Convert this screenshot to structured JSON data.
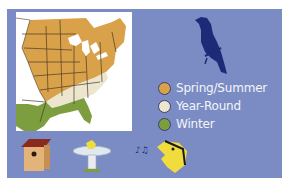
{
  "legend": {
    "items": [
      {
        "label": "Spring/Summer",
        "color": "#d9a24a"
      },
      {
        "label": "Year-Round",
        "color": "#ece6cf"
      },
      {
        "label": "Winter",
        "color": "#7d9e3e"
      }
    ]
  },
  "colors": {
    "panel_background": "#7b8cc4",
    "map_background": "#ffffff",
    "bird_silhouette": "#1c2a78"
  },
  "icons": [
    "bird-silhouette-icon",
    "birdhouse-icon",
    "birdbath-icon",
    "singing-bird-icon"
  ]
}
